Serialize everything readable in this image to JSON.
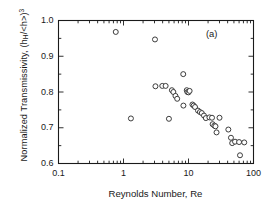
{
  "figure": {
    "panel_label": "(a)",
    "marker_style": "open-circle",
    "marker_color": "#333333",
    "background": "#ffffff",
    "axis_color": "#1a1a1a"
  },
  "chart_data": {
    "type": "scatter",
    "title": "",
    "panel": "(a)",
    "xlabel": "Reynolds Number,  Re",
    "ylabel": "Normalized Transmissivity,  (hₕ/<h>)³",
    "ylabel_parts": {
      "prefix": "Normalized Transmissivity,  (h",
      "subscript": "H",
      "middle": "/<h>)",
      "superscript": "3"
    },
    "xscale": "log",
    "yscale": "linear",
    "xlim": [
      0.1,
      100
    ],
    "ylim": [
      0.6,
      1.0
    ],
    "xticks": [
      0.1,
      1,
      10,
      100
    ],
    "xtick_labels": [
      "0.1",
      "1",
      "10",
      "100"
    ],
    "yticks": [
      0.6,
      0.7,
      0.8,
      0.9,
      1.0
    ],
    "ytick_labels": [
      "0.6",
      "0.7",
      "0.8",
      "0.9",
      "1.0"
    ],
    "minor_ticks": true,
    "tick_direction": "in",
    "grid": false,
    "legend": null,
    "series": [
      {
        "name": "Normalized transmissivity vs Re",
        "marker": "open-circle",
        "points": [
          [
            0.76,
            0.968
          ],
          [
            1.3,
            0.726
          ],
          [
            3.05,
            0.947
          ],
          [
            3.1,
            0.816
          ],
          [
            3.95,
            0.817
          ],
          [
            4.45,
            0.817
          ],
          [
            5.0,
            0.725
          ],
          [
            5.55,
            0.805
          ],
          [
            5.85,
            0.8
          ],
          [
            6.3,
            0.789
          ],
          [
            6.7,
            0.781
          ],
          [
            8.3,
            0.85
          ],
          [
            8.35,
            0.762
          ],
          [
            9.4,
            0.805
          ],
          [
            9.6,
            0.8
          ],
          [
            10.0,
            0.799
          ],
          [
            10.4,
            0.803
          ],
          [
            11.5,
            0.765
          ],
          [
            12.0,
            0.762
          ],
          [
            12.6,
            0.758
          ],
          [
            14.0,
            0.748
          ],
          [
            15.0,
            0.744
          ],
          [
            16.0,
            0.741
          ],
          [
            17.3,
            0.734
          ],
          [
            18.5,
            0.727
          ],
          [
            21.0,
            0.729
          ],
          [
            23.0,
            0.728
          ],
          [
            23.5,
            0.71
          ],
          [
            25.0,
            0.706
          ],
          [
            26.0,
            0.704
          ],
          [
            27.0,
            0.687
          ],
          [
            30.0,
            0.728
          ],
          [
            41.0,
            0.695
          ],
          [
            45.0,
            0.672
          ],
          [
            47.0,
            0.657
          ],
          [
            52.0,
            0.661
          ],
          [
            60.0,
            0.66
          ],
          [
            62.0,
            0.623
          ],
          [
            72.0,
            0.659
          ]
        ]
      }
    ]
  }
}
